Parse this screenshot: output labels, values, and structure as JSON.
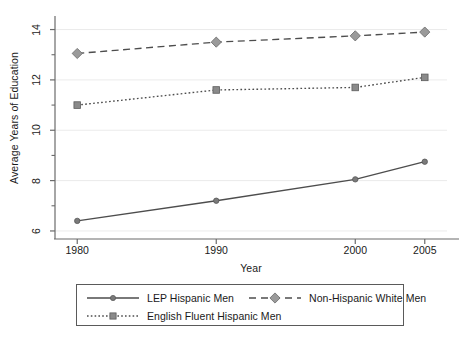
{
  "chart_data": {
    "type": "line",
    "title": "",
    "xlabel": "Year",
    "ylabel": "Average Years of Education",
    "x": [
      1980,
      1990,
      2000,
      2005
    ],
    "xtick_labels": [
      "1980",
      "1990",
      "2000",
      "2005"
    ],
    "ytick_labels": [
      "6",
      "8",
      "10",
      "12",
      "14"
    ],
    "ytick_values": [
      6,
      8,
      10,
      12,
      14
    ],
    "yminor_values": [
      7,
      9,
      11,
      13
    ],
    "xlim": [
      1978.4,
      2006.6
    ],
    "ylim": [
      5.72,
      14.3
    ],
    "grid": "horizontal-major",
    "legend_position": "below",
    "series": [
      {
        "name": "LEP Hispanic Men",
        "values": [
          6.4,
          7.2,
          8.05,
          8.75
        ],
        "line_style": "solid",
        "marker": "circle",
        "color": "#4d4d4d",
        "marker_color": "#7a7a7a"
      },
      {
        "name": "Non-Hispanic White Men",
        "values": [
          13.05,
          13.5,
          13.75,
          13.9
        ],
        "line_style": "dashed",
        "marker": "diamond",
        "color": "#4d4d4d",
        "marker_color": "#9a9a9a"
      },
      {
        "name": "English Fluent Hispanic Men",
        "values": [
          11.0,
          11.6,
          11.7,
          12.1
        ],
        "line_style": "dotted",
        "marker": "square",
        "color": "#4d4d4d",
        "marker_color": "#8a8a8a"
      }
    ]
  },
  "legend": {
    "entries": [
      {
        "label": "LEP Hispanic Men"
      },
      {
        "label": "Non-Hispanic White Men"
      },
      {
        "label": "English Fluent Hispanic Men"
      }
    ]
  },
  "colors": {
    "axis": "#6b6b6b",
    "grid": "#ebebeb",
    "line": "#4d4d4d",
    "text": "#1a1a1a",
    "legend_border": "#5a5a5a",
    "background": "#ffffff"
  }
}
